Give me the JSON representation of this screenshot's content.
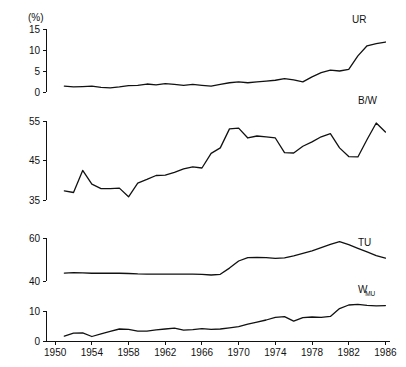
{
  "figure": {
    "unit_label": "(%)",
    "x_axis": {
      "label": "",
      "ticks": [
        1950,
        1954,
        1958,
        1962,
        1966,
        1970,
        1974,
        1978,
        1982,
        1986
      ],
      "tick_labels": [
        "1950",
        "1954",
        "1958",
        "1962",
        "1966",
        "1970",
        "1974",
        "1978",
        "1982",
        "1986"
      ],
      "range": [
        1949,
        1986.5
      ]
    },
    "panels": [
      {
        "key": "ur",
        "series_label": "UR",
        "series_sublabel": "",
        "y_ticks": [
          0,
          5,
          10,
          15
        ],
        "y_tick_labels": [
          "0",
          "5",
          "10",
          "15"
        ],
        "ylim": [
          0,
          15
        ]
      },
      {
        "key": "bw",
        "series_label": "B/W",
        "series_sublabel": "",
        "y_ticks": [
          35,
          45,
          55
        ],
        "y_tick_labels": [
          "35",
          "45",
          "55"
        ],
        "ylim": [
          35,
          55
        ]
      },
      {
        "key": "tu",
        "series_label": "TU",
        "series_sublabel": "",
        "y_ticks": [
          40,
          60
        ],
        "y_tick_labels": [
          "40",
          "60"
        ],
        "ylim": [
          40,
          60
        ]
      },
      {
        "key": "wmu",
        "series_label": "W",
        "series_sublabel": "MU",
        "y_ticks": [
          0,
          10
        ],
        "y_tick_labels": [
          "0",
          "10"
        ],
        "ylim": [
          0,
          14
        ]
      }
    ]
  },
  "chart_data": [
    {
      "type": "line",
      "title": "",
      "name": "UR",
      "xlabel": "",
      "ylabel": "(%)",
      "xlim": [
        1949,
        1986.5
      ],
      "ylim": [
        0,
        15
      ],
      "grid": false,
      "legend": "inline-right",
      "x": [
        1951,
        1952,
        1953,
        1954,
        1955,
        1956,
        1957,
        1958,
        1959,
        1960,
        1961,
        1962,
        1963,
        1964,
        1965,
        1966,
        1967,
        1968,
        1969,
        1970,
        1971,
        1972,
        1973,
        1974,
        1975,
        1976,
        1977,
        1978,
        1979,
        1980,
        1981,
        1982,
        1983,
        1984,
        1985,
        1986
      ],
      "values": [
        1.4,
        1.2,
        1.3,
        1.4,
        1.1,
        1.0,
        1.2,
        1.5,
        1.6,
        1.9,
        1.7,
        2.0,
        1.8,
        1.6,
        1.8,
        1.6,
        1.4,
        1.8,
        2.2,
        2.4,
        2.2,
        2.4,
        2.6,
        2.8,
        3.2,
        2.9,
        2.4,
        3.6,
        4.6,
        5.2,
        5.0,
        5.4,
        8.6,
        11.0,
        11.5,
        11.9
      ],
      "annotations": [
        "UR"
      ]
    },
    {
      "type": "line",
      "title": "",
      "name": "B/W",
      "xlabel": "",
      "ylabel": "",
      "xlim": [
        1949,
        1986.5
      ],
      "ylim": [
        35,
        55
      ],
      "grid": false,
      "legend": "inline-right",
      "x": [
        1951,
        1952,
        1953,
        1954,
        1955,
        1956,
        1957,
        1958,
        1959,
        1960,
        1961,
        1962,
        1963,
        1964,
        1965,
        1966,
        1967,
        1968,
        1969,
        1970,
        1971,
        1972,
        1973,
        1974,
        1975,
        1976,
        1977,
        1978,
        1979,
        1980,
        1981,
        1982,
        1983,
        1984,
        1985,
        1986
      ],
      "values": [
        37.3,
        36.9,
        42.5,
        39.0,
        37.9,
        37.9,
        38.0,
        35.8,
        39.3,
        40.2,
        41.2,
        41.3,
        42.0,
        42.9,
        43.4,
        43.1,
        46.8,
        48.2,
        53.0,
        53.2,
        50.7,
        51.2,
        51.0,
        50.7,
        47.0,
        46.9,
        48.6,
        49.7,
        51.0,
        51.8,
        48.2,
        46.0,
        45.9,
        50.3,
        54.5,
        52.2
      ],
      "annotations": [
        "B/W"
      ]
    },
    {
      "type": "line",
      "title": "",
      "name": "TU",
      "xlabel": "",
      "ylabel": "",
      "xlim": [
        1949,
        1986.5
      ],
      "ylim": [
        40,
        60
      ],
      "grid": false,
      "legend": "inline-right",
      "x": [
        1951,
        1952,
        1953,
        1954,
        1955,
        1956,
        1957,
        1958,
        1959,
        1960,
        1961,
        1962,
        1963,
        1964,
        1965,
        1966,
        1967,
        1968,
        1969,
        1970,
        1971,
        1972,
        1973,
        1974,
        1975,
        1976,
        1977,
        1978,
        1979,
        1980,
        1981,
        1982,
        1983,
        1984,
        1985,
        1986
      ],
      "values": [
        43.7,
        43.9,
        43.8,
        43.6,
        43.6,
        43.6,
        43.6,
        43.5,
        43.3,
        43.2,
        43.2,
        43.2,
        43.2,
        43.2,
        43.2,
        43.1,
        42.8,
        43.1,
        46.0,
        49.3,
        50.9,
        51.0,
        50.9,
        50.5,
        50.8,
        51.7,
        52.8,
        54.0,
        55.5,
        57.0,
        58.3,
        56.9,
        55.2,
        53.5,
        51.8,
        50.6
      ],
      "annotations": [
        "TU"
      ]
    },
    {
      "type": "line",
      "title": "",
      "name": "W_MU",
      "xlabel": "",
      "ylabel": "",
      "xlim": [
        1949,
        1986.5
      ],
      "ylim": [
        0,
        14
      ],
      "grid": false,
      "legend": "inline-right",
      "x": [
        1951,
        1952,
        1953,
        1954,
        1955,
        1956,
        1957,
        1958,
        1959,
        1960,
        1961,
        1962,
        1963,
        1964,
        1965,
        1966,
        1967,
        1968,
        1969,
        1970,
        1971,
        1972,
        1973,
        1974,
        1975,
        1976,
        1977,
        1978,
        1979,
        1980,
        1981,
        1982,
        1983,
        1984,
        1985,
        1986
      ],
      "values": [
        1.6,
        2.6,
        2.7,
        1.5,
        2.4,
        3.2,
        4.0,
        3.9,
        3.3,
        3.3,
        3.7,
        4.0,
        4.3,
        3.6,
        3.8,
        4.1,
        3.9,
        4.0,
        4.4,
        4.8,
        5.6,
        6.3,
        7.0,
        7.9,
        8.1,
        6.6,
        7.8,
        8.0,
        7.9,
        8.2,
        10.8,
        12.0,
        12.2,
        11.9,
        11.7,
        11.8
      ],
      "annotations": [
        "W",
        "MU"
      ]
    }
  ]
}
